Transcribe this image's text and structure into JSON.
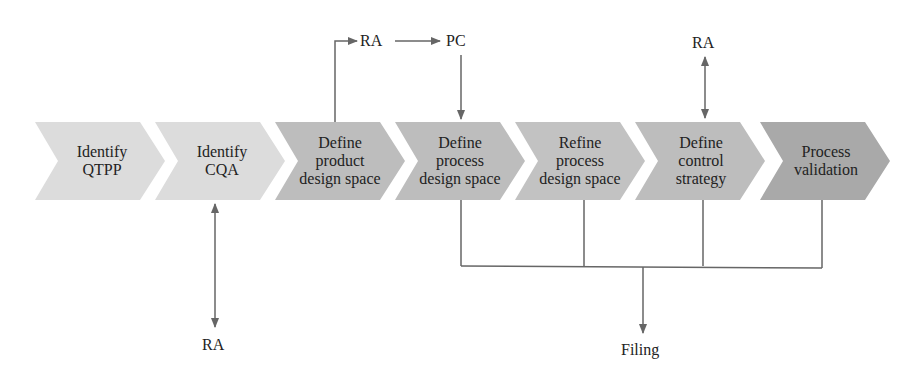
{
  "colors": {
    "light_step": "#dcdcdc",
    "mid_step": "#bdbdbd",
    "dark_step": "#a9a9a9",
    "connector": "#666666",
    "text": "#222222"
  },
  "steps": [
    {
      "lines": [
        "Identify",
        "QTPP"
      ],
      "shade": "light"
    },
    {
      "lines": [
        "Identify",
        "CQA"
      ],
      "shade": "light"
    },
    {
      "lines": [
        "Define",
        "product",
        "design space"
      ],
      "shade": "mid"
    },
    {
      "lines": [
        "Define",
        "process",
        "design space"
      ],
      "shade": "mid"
    },
    {
      "lines": [
        "Refine",
        "process",
        "design space"
      ],
      "shade": "mid"
    },
    {
      "lines": [
        "Define",
        "control",
        "strategy"
      ],
      "shade": "mid"
    },
    {
      "lines": [
        "Process",
        "validation"
      ],
      "shade": "dark"
    }
  ],
  "nodes": {
    "ra_top_left": "RA",
    "pc_top": "PC",
    "ra_top_right": "RA",
    "ra_bottom": "RA",
    "filing": "Filing"
  }
}
